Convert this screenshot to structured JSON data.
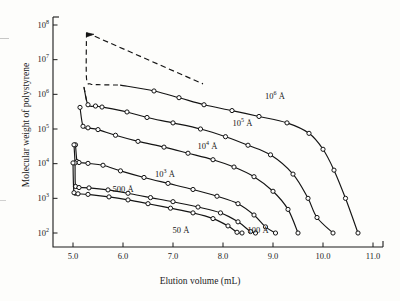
{
  "figure": {
    "background_color": "#fdfdfb",
    "axis_color": "#1b1b1b",
    "curve_color": "#141414",
    "marker_fill": "#ffffff"
  },
  "axes": {
    "x": {
      "title": "Elution volume (mL)",
      "min": 4.6,
      "max": 11.2,
      "scale": "linear",
      "ticks": [
        5.0,
        6.0,
        7.0,
        8.0,
        9.0,
        10.0,
        11.0
      ],
      "tick_labels": [
        "5.0",
        "6.0",
        "7.0",
        "8.0",
        "9.0",
        "10.0",
        "11.0"
      ]
    },
    "y": {
      "title": "Molecular weight of polystyrene",
      "min": 100,
      "max": 100000000,
      "scale": "log10",
      "ticks": [
        100,
        1000,
        10000,
        100000,
        1000000,
        10000000,
        100000000
      ],
      "tick_mantissas": [
        "10",
        "10",
        "10",
        "10",
        "10",
        "10",
        "10"
      ],
      "tick_exponents": [
        "2",
        "3",
        "4",
        "5",
        "6",
        "7",
        "8"
      ]
    },
    "grid": false,
    "legend": "inline-curve-labels"
  },
  "chart_data": {
    "type": "line",
    "title": "",
    "subtitle": "",
    "xlabel": "Elution volume (mL)",
    "ylabel": "Molecular weight of polystyrene",
    "xlim": [
      4.6,
      11.2
    ],
    "ylim": [
      100,
      100000000
    ],
    "yscale": "log",
    "xscale": "linear",
    "grid": false,
    "legend_position": "inline annotations along curves",
    "annotations": [
      {
        "text": "10⁶ Å",
        "x": 9.1,
        "y": 900000
      },
      {
        "text": "10⁵ Å",
        "x": 8.45,
        "y": 150000
      },
      {
        "text": "10⁴ Å",
        "x": 7.75,
        "y": 32000
      },
      {
        "text": "10³ Å",
        "x": 6.9,
        "y": 5200
      },
      {
        "text": "500 Å",
        "x": 6.05,
        "y": 1700
      },
      {
        "text": "50 Å",
        "x": 7.25,
        "y": 118
      },
      {
        "text": "100 Å",
        "x": 8.75,
        "y": 118
      }
    ],
    "series": [
      {
        "name": "10⁶ Å",
        "label": "10⁶ Å",
        "dashed_segment": {
          "points": [
            [
              5.27,
              60000000
            ],
            [
              5.27,
              2900000
            ],
            [
              5.35,
              2000000
            ],
            [
              5.5,
              1900000
            ],
            [
              5.95,
              1850000
            ]
          ],
          "arrow_head_at": [
            5.27,
            60000000
          ],
          "extra_dashed_to": [
            7.6,
            2000000
          ]
        },
        "points": [
          [
            5.95,
            1850000
          ],
          [
            6.62,
            1250000
          ],
          [
            7.12,
            800000
          ],
          [
            7.62,
            500000
          ],
          [
            8.18,
            340000
          ],
          [
            8.72,
            230000
          ],
          [
            9.28,
            150000
          ],
          [
            9.72,
            75000
          ],
          [
            10.0,
            26000
          ],
          [
            10.22,
            6500
          ],
          [
            10.45,
            1000
          ],
          [
            10.7,
            100
          ]
        ]
      },
      {
        "name": "10⁵ Å",
        "label": "10⁵ Å",
        "dashed_segment": {
          "points": [
            [
              5.22,
              1600000
            ],
            [
              5.28,
              560000
            ]
          ]
        },
        "points": [
          [
            5.22,
            1600000
          ],
          [
            5.3,
            500000
          ],
          [
            5.45,
            460000
          ],
          [
            5.58,
            430000
          ],
          [
            6.08,
            310000
          ],
          [
            6.48,
            215000
          ],
          [
            7.0,
            150000
          ],
          [
            7.55,
            100000
          ],
          [
            8.05,
            60000
          ],
          [
            8.5,
            34000
          ],
          [
            8.95,
            18000
          ],
          [
            9.4,
            5000
          ],
          [
            9.7,
            1000
          ],
          [
            9.88,
            280
          ],
          [
            10.2,
            100
          ]
        ]
      },
      {
        "name": "10⁴ Å",
        "label": "10⁴ Å",
        "points": [
          [
            5.14,
            420000
          ],
          [
            5.2,
            120000
          ],
          [
            5.3,
            108000
          ],
          [
            5.5,
            96000
          ],
          [
            5.85,
            66000
          ],
          [
            6.3,
            44000
          ],
          [
            6.82,
            30000
          ],
          [
            7.3,
            20000
          ],
          [
            7.8,
            13000
          ],
          [
            8.22,
            8000
          ],
          [
            8.62,
            4200
          ],
          [
            9.0,
            1600
          ],
          [
            9.3,
            480
          ],
          [
            9.5,
            100
          ]
        ]
      },
      {
        "name": "10³ Å",
        "label": "10³ Å",
        "points": [
          [
            5.05,
            35000
          ],
          [
            5.08,
            11500
          ],
          [
            5.12,
            10800
          ],
          [
            5.3,
            10200
          ],
          [
            5.6,
            9000
          ],
          [
            5.95,
            6200
          ],
          [
            6.42,
            4000
          ],
          [
            6.9,
            2700
          ],
          [
            7.4,
            1800
          ],
          [
            7.88,
            1150
          ],
          [
            8.3,
            700
          ],
          [
            8.62,
            330
          ],
          [
            8.85,
            150
          ],
          [
            9.05,
            100
          ]
        ]
      },
      {
        "name": "500 Å",
        "label": "500 Å",
        "points": [
          [
            5.02,
            35000
          ],
          [
            5.04,
            10500
          ],
          [
            5.05,
            2200
          ],
          [
            5.12,
            2050
          ],
          [
            5.32,
            2000
          ],
          [
            5.7,
            1750
          ],
          [
            6.1,
            1400
          ],
          [
            6.55,
            1050
          ],
          [
            7.0,
            800
          ],
          [
            7.5,
            560
          ],
          [
            7.95,
            380
          ],
          [
            8.3,
            210
          ],
          [
            8.55,
            110
          ],
          [
            8.65,
            100
          ]
        ]
      },
      {
        "name": "50 Å",
        "label": "50 Å",
        "points": [
          [
            5.0,
            10500
          ],
          [
            5.02,
            1450
          ],
          [
            5.1,
            1350
          ],
          [
            5.3,
            1300
          ],
          [
            5.72,
            1100
          ],
          [
            6.1,
            900
          ],
          [
            6.5,
            700
          ],
          [
            6.95,
            520
          ],
          [
            7.4,
            380
          ],
          [
            7.8,
            260
          ],
          [
            8.1,
            160
          ],
          [
            8.28,
            105
          ],
          [
            8.38,
            100
          ]
        ]
      }
    ]
  }
}
